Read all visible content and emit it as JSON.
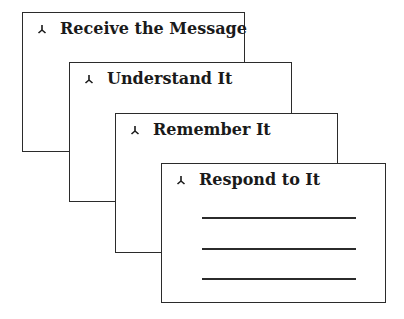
{
  "diagram": {
    "cards": [
      {
        "label": "Receive the Message",
        "icon": "arrowhead-bullet-icon"
      },
      {
        "label": "Understand It",
        "icon": "arrowhead-bullet-icon"
      },
      {
        "label": "Remember It",
        "icon": "arrowhead-bullet-icon"
      },
      {
        "label": "Respond to It",
        "icon": "arrowhead-bullet-icon",
        "blank_lines": 3
      }
    ],
    "colors": {
      "stroke": "#2b2b2b",
      "text": "#1a1a1a",
      "background": "#ffffff"
    }
  }
}
